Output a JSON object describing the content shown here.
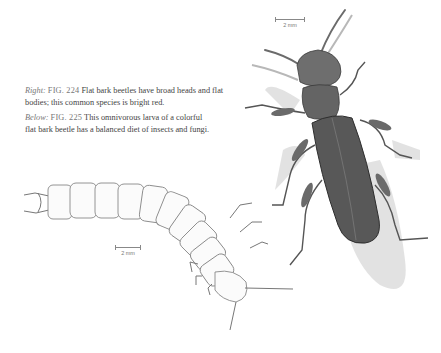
{
  "captions": {
    "fig224": {
      "position_label": "Right:",
      "figure_label": "FIG. 224",
      "text": "Flat bark beetles have broad heads and flat bodies; this common species is bright red."
    },
    "fig225": {
      "position_label": "Below:",
      "figure_label": "FIG. 225",
      "text": "This omnivorous larva of a colorful flat bark beetle has a balanced diet of insects and fungi."
    }
  },
  "illustrations": {
    "beetle": {
      "name": "flat-bark-beetle-adult",
      "scale_label": "2 mm"
    },
    "larva": {
      "name": "flat-bark-beetle-larva",
      "scale_label": "2 mm"
    }
  },
  "colors": {
    "ink": "#444444",
    "beetle_body": "#5a5a5a",
    "shadow": "#d6d6d6",
    "paper": "#ffffff"
  }
}
